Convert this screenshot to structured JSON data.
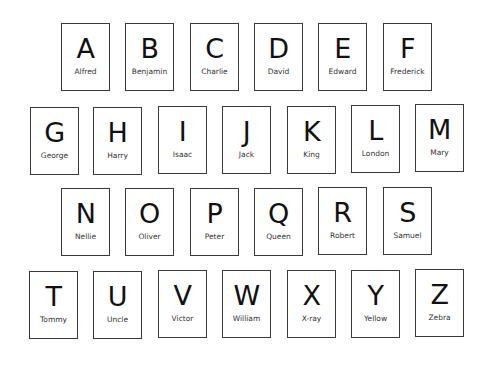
{
  "cards": [
    {
      "letter": "A",
      "name": "Alfred",
      "x": 61,
      "y": 23
    },
    {
      "letter": "B",
      "name": "Benjamin",
      "x": 125,
      "y": 23
    },
    {
      "letter": "C",
      "name": "Charlie",
      "x": 190,
      "y": 23
    },
    {
      "letter": "D",
      "name": "David",
      "x": 254,
      "y": 23
    },
    {
      "letter": "E",
      "name": "Edward",
      "x": 318,
      "y": 23
    },
    {
      "letter": "F",
      "name": "Frederick",
      "x": 383,
      "y": 23
    },
    {
      "letter": "G",
      "name": "George",
      "x": 30,
      "y": 107
    },
    {
      "letter": "H",
      "name": "Harry",
      "x": 93,
      "y": 107
    },
    {
      "letter": "I",
      "name": "Isaac",
      "x": 158,
      "y": 106
    },
    {
      "letter": "J",
      "name": "Jack",
      "x": 222,
      "y": 106
    },
    {
      "letter": "K",
      "name": "King",
      "x": 287,
      "y": 106
    },
    {
      "letter": "L",
      "name": "London",
      "x": 351,
      "y": 105
    },
    {
      "letter": "M",
      "name": "Mary",
      "x": 415,
      "y": 104
    },
    {
      "letter": "N",
      "name": "Nellie",
      "x": 61,
      "y": 188
    },
    {
      "letter": "O",
      "name": "Oliver",
      "x": 125,
      "y": 188
    },
    {
      "letter": "P",
      "name": "Peter",
      "x": 190,
      "y": 188
    },
    {
      "letter": "Q",
      "name": "Queen",
      "x": 254,
      "y": 188
    },
    {
      "letter": "R",
      "name": "Robert",
      "x": 318,
      "y": 187
    },
    {
      "letter": "S",
      "name": "Samuel",
      "x": 383,
      "y": 187
    },
    {
      "letter": "T",
      "name": "Tommy",
      "x": 29,
      "y": 271
    },
    {
      "letter": "U",
      "name": "Uncle",
      "x": 93,
      "y": 271
    },
    {
      "letter": "V",
      "name": "Victor",
      "x": 158,
      "y": 270
    },
    {
      "letter": "W",
      "name": "William",
      "x": 222,
      "y": 270
    },
    {
      "letter": "X",
      "name": "X-ray",
      "x": 287,
      "y": 270
    },
    {
      "letter": "Y",
      "name": "Yellow",
      "x": 351,
      "y": 270
    },
    {
      "letter": "Z",
      "name": "Zebra",
      "x": 415,
      "y": 269
    }
  ]
}
